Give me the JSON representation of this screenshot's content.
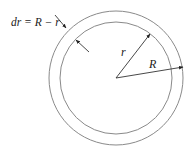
{
  "diagram": {
    "labels": {
      "thickness": "dr = R − r",
      "inner_radius": "r",
      "outer_radius": "R"
    },
    "geometry": {
      "center": [
        116,
        78
      ],
      "outer_radius_px": 67,
      "inner_radius_px": 56
    },
    "colors": {
      "stroke": "#555555",
      "circle_stroke": "#8a8a8a",
      "background": "#ffffff"
    }
  }
}
